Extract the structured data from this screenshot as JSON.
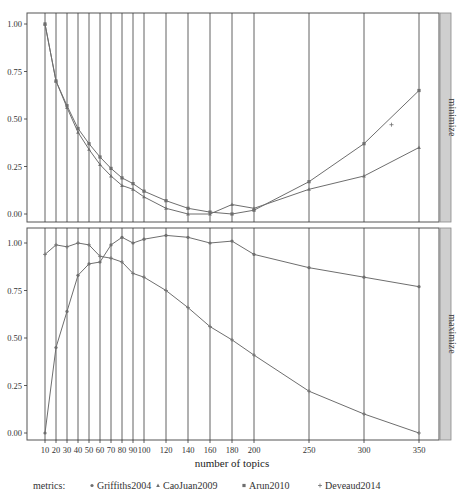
{
  "chart_data": {
    "type": "line",
    "title": "",
    "xlabel": "number of topics",
    "ylabel": "",
    "x": [
      10,
      20,
      30,
      40,
      50,
      60,
      70,
      80,
      90,
      100,
      120,
      140,
      160,
      180,
      200,
      250,
      300,
      350
    ],
    "x_tick_labels": [
      "10",
      "20",
      "30",
      "40",
      "50",
      "60",
      "70",
      "80",
      "90",
      "100",
      "120",
      "140",
      "160",
      "180",
      "200",
      "250",
      "300",
      "350"
    ],
    "y_tick_labels": [
      "0.00",
      "0.25",
      "0.50",
      "0.75",
      "1.00"
    ],
    "ylim": [
      0,
      1.05
    ],
    "grid": "vertical lines at each x",
    "legend_position": "bottom",
    "legend_title": "metrics:",
    "panels": [
      {
        "label": "minimize",
        "series": [
          {
            "name": "Arun2010",
            "marker": "square",
            "values": [
              1.0,
              0.7,
              0.57,
              0.45,
              0.37,
              0.3,
              0.24,
              0.19,
              0.16,
              0.12,
              0.07,
              0.03,
              0.01,
              0.0,
              0.02,
              0.17,
              0.37,
              0.65
            ]
          },
          {
            "name": "CaoJuan2009",
            "marker": "triangle",
            "values": [
              1.0,
              0.7,
              0.56,
              0.43,
              0.34,
              0.26,
              0.2,
              0.15,
              0.13,
              0.09,
              0.03,
              0.0,
              0.0,
              0.05,
              0.03,
              0.13,
              0.2,
              0.35
            ]
          }
        ]
      },
      {
        "label": "maximize",
        "series": [
          {
            "name": "Deveaud2014",
            "marker": "plus",
            "values": [
              0.94,
              0.99,
              0.98,
              1.0,
              0.99,
              0.93,
              0.92,
              0.9,
              0.84,
              0.82,
              0.75,
              0.66,
              0.56,
              0.49,
              0.41,
              0.22,
              0.1,
              0.0
            ]
          },
          {
            "name": "Griffiths2004",
            "marker": "circle",
            "values": [
              0.0,
              0.45,
              0.64,
              0.83,
              0.89,
              0.9,
              0.99,
              1.03,
              1.0,
              1.02,
              1.04,
              1.03,
              1.0,
              1.01,
              0.94,
              0.87,
              0.82,
              0.77
            ]
          }
        ]
      }
    ]
  },
  "legend": {
    "title": "metrics:",
    "items": [
      {
        "label": "Griffiths2004",
        "symbol": "●"
      },
      {
        "label": "CaoJuan2009",
        "symbol": "▲"
      },
      {
        "label": "Arun2010",
        "symbol": "■"
      },
      {
        "label": "Deveaud2014",
        "symbol": "+"
      }
    ]
  },
  "colors": {
    "line": "#6e6e6e",
    "grid": "#3a3a3a",
    "frame": "#555555",
    "strip": "#cfcfcf"
  }
}
